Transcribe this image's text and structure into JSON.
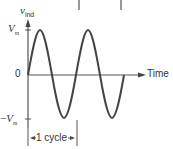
{
  "diagram": {
    "type": "sinusoid-waveform",
    "y_axis": {
      "label": "v",
      "label_subscript": "ind",
      "max_label": "V",
      "max_label_subscript": "m",
      "min_label_prefix": "−",
      "min_label": "V",
      "min_label_subscript": "m",
      "zero_label": "0"
    },
    "x_axis": {
      "label": "Time"
    },
    "annotation": {
      "cycle_label": "1 cycle"
    },
    "colors": {
      "curve": "#444444",
      "axis": "#555555",
      "text": "#333333"
    }
  }
}
